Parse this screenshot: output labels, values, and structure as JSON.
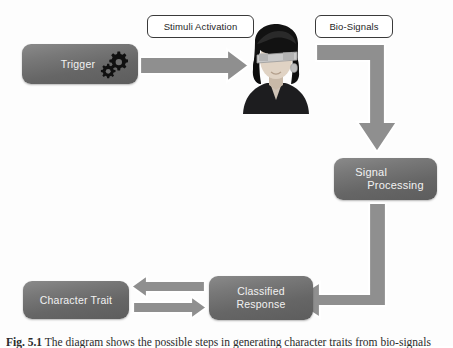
{
  "diagram": {
    "title_implicit": "Bio-signal based character trait classification flow",
    "colors": {
      "box_fill": "#6e6e6e",
      "box_text": "#f2f2f2",
      "arrow_fill": "#8f8f8f",
      "arrow_outline": "#ffffff",
      "chip_border": "#3a3a3a",
      "chip_fill": "#ffffff",
      "background": "#fdfdfd",
      "gear": "#111111"
    },
    "nodes": [
      {
        "id": "trigger",
        "label": "Trigger",
        "icon": "gears-icon",
        "shape": "rounded-rect"
      },
      {
        "id": "subject",
        "label": "",
        "icon": "person-with-eeg-headset-icon",
        "shape": "image"
      },
      {
        "id": "signal",
        "label_line1": "Signal",
        "label_line2": "Processing",
        "shape": "rounded-rect"
      },
      {
        "id": "classified",
        "label_line1": "Classified",
        "label_line2": "Response",
        "shape": "rounded-rect"
      },
      {
        "id": "trait",
        "label": "Character Trait",
        "shape": "rounded-rect"
      }
    ],
    "edge_labels": [
      {
        "id": "stimuli",
        "label": "Stimuli Activation"
      },
      {
        "id": "bio",
        "label": "Bio-Signals"
      }
    ],
    "edges": [
      {
        "from": "trigger",
        "to": "subject",
        "label": "Stimuli Activation",
        "direction": "right"
      },
      {
        "from": "subject",
        "to": "signal",
        "label": "Bio-Signals",
        "direction": "right-then-down"
      },
      {
        "from": "signal",
        "to": "classified",
        "label": "",
        "direction": "down-then-left"
      },
      {
        "from": "classified",
        "to": "trait",
        "label": "",
        "direction": "left"
      },
      {
        "from": "trait",
        "to": "classified",
        "label": "",
        "direction": "right"
      }
    ]
  },
  "caption": {
    "figure_number": "Fig. 5.1",
    "text": "The diagram shows the possible steps in generating character traits from bio-signals"
  }
}
